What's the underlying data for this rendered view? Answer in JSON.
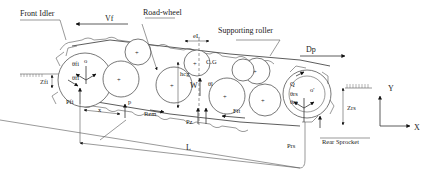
{
  "diagram": {
    "labels": {
      "front_idler": "Front Idler",
      "vf": "Vf",
      "road_wheel": "Road-wheel",
      "el": "eL",
      "supporting_roller": "Supporting roller",
      "dp": "Dp",
      "cg": "C.G",
      "hcg": "hcg",
      "w": "W",
      "theta_l": "θl",
      "theta_fi_top": "θfi",
      "theta_fi_bottom": "θfi",
      "o": "o",
      "o_prime": "o'",
      "q": "Q",
      "theta_rs_top": "θrs",
      "theta_rs_bottom": "θrs",
      "zfi": "Zfi",
      "zrs": "Zrs",
      "pfi": "Pfi",
      "prs": "Prs",
      "x_small": "x",
      "p": "p",
      "rzm": "Rzm",
      "pz": "Pz",
      "fit": "Fit",
      "l": "L",
      "rear_sprocket": "Rear Sprocket",
      "axis_y": "Y",
      "axis_x": "X"
    },
    "components": [
      "Front Idler",
      "Road-wheel",
      "Supporting roller",
      "Rear Sprocket"
    ],
    "colors": {
      "line": "#333333",
      "background": "#ffffff"
    }
  }
}
